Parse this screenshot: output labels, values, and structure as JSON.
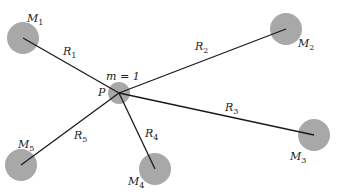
{
  "colors": {
    "mass_fill": "#a8a8a8",
    "line": "#1a1a1a",
    "text": "#222222",
    "background": "#ffffff"
  },
  "center": {
    "point_label": "P",
    "mass_label": "m = 1",
    "x": 119,
    "y": 93,
    "r": 11
  },
  "masses": [
    {
      "name": "M",
      "sub": "1",
      "x": 23,
      "y": 38,
      "r": 16,
      "lx": 27,
      "ly": 22,
      "link": "R",
      "link_sub": "1",
      "rx": 63,
      "ry": 55
    },
    {
      "name": "M",
      "sub": "2",
      "x": 286,
      "y": 29,
      "r": 16,
      "lx": 298,
      "ly": 47,
      "link": "R",
      "link_sub": "2",
      "rx": 195,
      "ry": 50
    },
    {
      "name": "M",
      "sub": "3",
      "x": 314,
      "y": 135,
      "r": 16,
      "lx": 290,
      "ly": 160,
      "link": "R",
      "link_sub": "3",
      "rx": 225,
      "ry": 111
    },
    {
      "name": "M",
      "sub": "4",
      "x": 155,
      "y": 169,
      "r": 16,
      "lx": 128,
      "ly": 185,
      "link": "R",
      "link_sub": "4",
      "rx": 145,
      "ry": 137
    },
    {
      "name": "M",
      "sub": "5",
      "x": 21,
      "y": 165,
      "r": 16,
      "lx": 18,
      "ly": 148,
      "link": "R",
      "link_sub": "5",
      "rx": 74,
      "ry": 139
    }
  ]
}
